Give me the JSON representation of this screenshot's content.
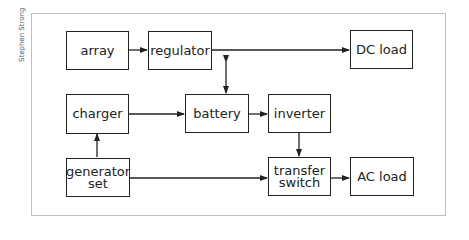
{
  "credit": "Stephen Strong",
  "nodes": {
    "array": "array",
    "regulator": "regulator",
    "dc_load": "DC load",
    "charger": "charger",
    "battery": "battery",
    "inverter": "inverter",
    "generator_line1": "generator",
    "generator_line2": "set",
    "transfer_line1": "transfer",
    "transfer_line2": "switch",
    "ac_load": "AC load"
  },
  "edges": [
    {
      "from": "array",
      "to": "regulator"
    },
    {
      "from": "regulator",
      "to": "DC load"
    },
    {
      "from": "regulator",
      "to": "battery",
      "bidirectional": true
    },
    {
      "from": "charger",
      "to": "battery"
    },
    {
      "from": "battery",
      "to": "inverter"
    },
    {
      "from": "generator set",
      "to": "charger"
    },
    {
      "from": "inverter",
      "to": "transfer switch"
    },
    {
      "from": "generator set",
      "to": "transfer switch"
    },
    {
      "from": "transfer switch",
      "to": "AC load"
    }
  ]
}
